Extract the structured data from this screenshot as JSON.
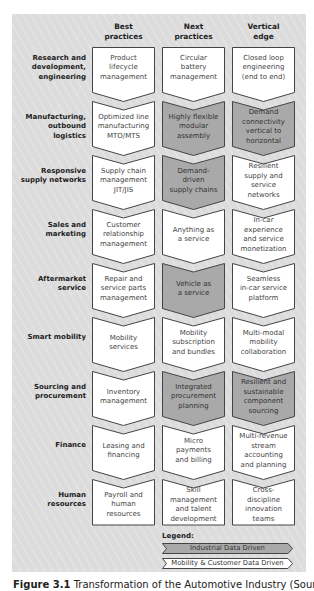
{
  "columns": [
    "Best\npractices",
    "Next\npractices",
    "Vertical\nedge"
  ],
  "column_lines": [
    [
      "Best",
      "practices"
    ],
    [
      "Next",
      "practices"
    ],
    [
      "Vertical",
      "edge"
    ]
  ],
  "rows": [
    {
      "label": [
        "Research and",
        "development,",
        "engineering"
      ],
      "cells": [
        {
          "text": [
            "Product",
            "lifecycle",
            "management"
          ],
          "type": "mobility"
        },
        {
          "text": [
            "Circular",
            "battery",
            "management"
          ],
          "type": "mobility"
        },
        {
          "text": [
            "Closed loop",
            "engineering",
            "(end to end)"
          ],
          "type": "mobility"
        }
      ]
    },
    {
      "label": [
        "Manufacturing,",
        "outbound logistics"
      ],
      "cells": [
        {
          "text": [
            "Optimized line",
            "manufacturing",
            "MTO/MTS"
          ],
          "type": "mobility"
        },
        {
          "text": [
            "Highly flexible",
            "modular",
            "assembly"
          ],
          "type": "industrial"
        },
        {
          "text": [
            "Demand",
            "connectivity",
            "vertical to",
            "horizontal"
          ],
          "type": "industrial"
        }
      ]
    },
    {
      "label": [
        "Responsive",
        "supply networks"
      ],
      "cells": [
        {
          "text": [
            "Supply chain",
            "management",
            "JIT/JIS"
          ],
          "type": "mobility"
        },
        {
          "text": [
            "Demand-",
            "driven",
            "supply chains"
          ],
          "type": "industrial"
        },
        {
          "text": [
            "Resilient",
            "supply and",
            "service",
            "networks"
          ],
          "type": "mobility"
        }
      ]
    },
    {
      "label": [
        "Sales and",
        "marketing"
      ],
      "cells": [
        {
          "text": [
            "Customer",
            "relationship",
            "management"
          ],
          "type": "mobility"
        },
        {
          "text": [
            "Anything as",
            "a service"
          ],
          "type": "mobility"
        },
        {
          "text": [
            "In-car",
            "experience",
            "and service",
            "monetization"
          ],
          "type": "mobility"
        }
      ]
    },
    {
      "label": [
        "Aftermarket",
        "service"
      ],
      "cells": [
        {
          "text": [
            "Repair and",
            "service parts",
            "management"
          ],
          "type": "mobility"
        },
        {
          "text": [
            "Vehicle as",
            "a service"
          ],
          "type": "industrial"
        },
        {
          "text": [
            "Seamless",
            "in-car service",
            "platform"
          ],
          "type": "mobility"
        }
      ]
    },
    {
      "label": [
        "Smart mobility"
      ],
      "cells": [
        {
          "text": [
            "Mobility",
            "services"
          ],
          "type": "mobility"
        },
        {
          "text": [
            "Mobility",
            "subscription",
            "and bundles"
          ],
          "type": "mobility"
        },
        {
          "text": [
            "Multi-modal",
            "mobility",
            "collaboration"
          ],
          "type": "mobility"
        }
      ]
    },
    {
      "label": [
        "Sourcing and",
        "procurement"
      ],
      "cells": [
        {
          "text": [
            "Inventory",
            "management"
          ],
          "type": "mobility"
        },
        {
          "text": [
            "Integrated",
            "procurement",
            "planning"
          ],
          "type": "industrial"
        },
        {
          "text": [
            "Resilient and",
            "sustainable",
            "component",
            "sourcing"
          ],
          "type": "industrial"
        }
      ]
    },
    {
      "label": [
        "Finance"
      ],
      "cells": [
        {
          "text": [
            "Leasing and",
            "financing"
          ],
          "type": "mobility"
        },
        {
          "text": [
            "Micro",
            "payments",
            "and billing"
          ],
          "type": "mobility"
        },
        {
          "text": [
            "Multi-revenue",
            "stream",
            "accounting",
            "and planning"
          ],
          "type": "mobility"
        }
      ]
    },
    {
      "label": [
        "Human",
        "resources"
      ],
      "cells": [
        {
          "text": [
            "Payroll and",
            "human",
            "resources"
          ],
          "type": "mobility"
        },
        {
          "text": [
            "Skill",
            "management",
            "and talent",
            "development"
          ],
          "type": "mobility"
        },
        {
          "text": [
            "Cross-",
            "discipline",
            "innovation",
            "teams"
          ],
          "type": "mobility"
        }
      ]
    }
  ],
  "legend": {
    "title": "Legend:",
    "items": [
      {
        "label": "Industrial Data Driven",
        "type": "industrial"
      },
      {
        "label": "Mobility & Customer Data Driven",
        "type": "mobility"
      }
    ]
  },
  "colors": {
    "panel_bg": "#dcdcdc",
    "industrial_fill": "#a9a9a9",
    "mobility_fill": "#ffffff",
    "stroke": "#444444"
  },
  "caption": {
    "prefix": "Figure 3.1",
    "text": "Transformation of the Automotive Industry (Sourc"
  }
}
